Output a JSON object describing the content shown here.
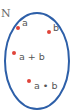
{
  "diagram": {
    "type": "set-diagram",
    "set": {
      "label": "N",
      "stroke_color": "#2d5fa8"
    },
    "dot_color": "#e0443a",
    "elements": [
      {
        "label": "a"
      },
      {
        "label": "b"
      },
      {
        "label": "a + b"
      },
      {
        "label": "a • b"
      }
    ]
  }
}
